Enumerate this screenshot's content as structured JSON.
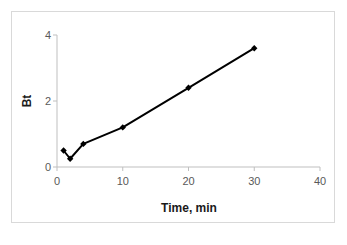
{
  "chart_data": {
    "type": "scatter",
    "title": "",
    "subtitle": "",
    "xlabel": "Time, min",
    "ylabel": "Bt",
    "xlim": [
      0,
      40
    ],
    "ylim": [
      0,
      4
    ],
    "xticks": [
      0,
      10,
      20,
      30,
      40
    ],
    "yticks": [
      0,
      2,
      4
    ],
    "xtick_labels": [
      "0",
      "10",
      "20",
      "30",
      "40"
    ],
    "ytick_labels": [
      "0",
      "2",
      "4"
    ],
    "grid": false,
    "legend": null,
    "legend_position": "none",
    "marker": "diamond",
    "marker_color": "#000000",
    "line_color": "#000000",
    "line_width": 2,
    "connected": true,
    "series": [
      {
        "name": "Bt",
        "x": [
          1,
          2,
          4,
          10,
          20,
          30
        ],
        "y": [
          0.5,
          0.25,
          0.7,
          1.2,
          2.4,
          3.6
        ]
      }
    ],
    "annotations": []
  },
  "axes": {
    "x_title": "Time, min",
    "y_title": "Bt",
    "x_ticks": [
      "0",
      "10",
      "20",
      "30",
      "40"
    ],
    "y_ticks": [
      "0",
      "2",
      "4"
    ]
  },
  "colors": {
    "frame_border": "#d9d9d9",
    "axis_line": "#bfbfbf",
    "tick_label": "#595959",
    "axis_title": "#1a1a1a",
    "data": "#000000",
    "background": "#ffffff"
  }
}
